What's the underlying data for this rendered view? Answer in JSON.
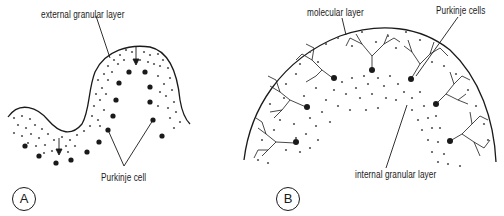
{
  "figure": {
    "panels": [
      {
        "id": "A",
        "letter": "A",
        "labels": {
          "external_granular_layer": "external granular layer",
          "purkinje_cell": "Purkinje cell"
        }
      },
      {
        "id": "B",
        "letter": "B",
        "labels": {
          "molecular_layer": "molecular layer",
          "purkinje_cells": "Purkinje cells",
          "internal_granular_layer": "internal granular layer"
        }
      }
    ],
    "colors": {
      "ink": "#1a1a1a",
      "granule": "#555555",
      "background": "#ffffff"
    }
  }
}
